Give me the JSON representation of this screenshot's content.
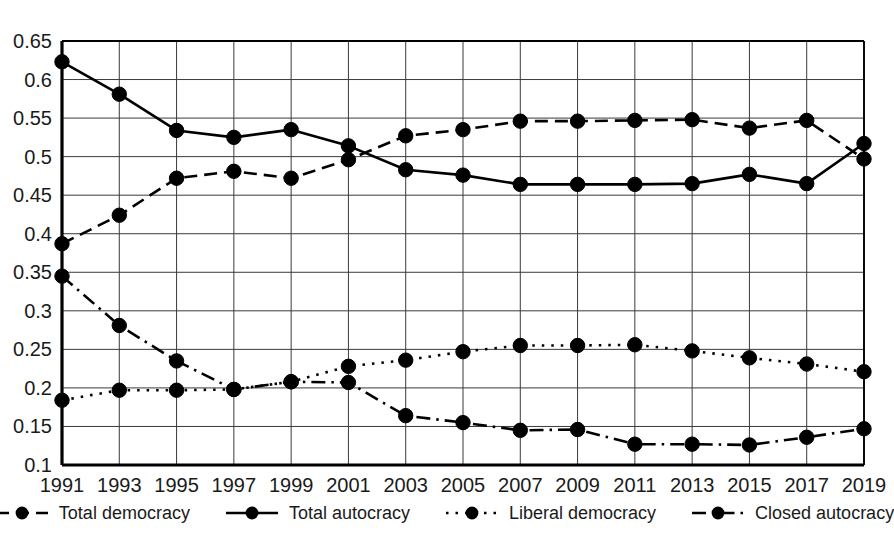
{
  "chart_data": {
    "type": "line",
    "title": "",
    "subtitle": "",
    "xlabel": "",
    "ylabel": "",
    "x": [
      1991,
      1993,
      1995,
      1997,
      1999,
      2001,
      2003,
      2005,
      2007,
      2009,
      2011,
      2013,
      2015,
      2017,
      2019
    ],
    "categories": [
      "1991",
      "1993",
      "1995",
      "1997",
      "1999",
      "2001",
      "2003",
      "2005",
      "2007",
      "2009",
      "2011",
      "2013",
      "2015",
      "2017",
      "2019"
    ],
    "xlim": [
      1991,
      2019
    ],
    "ylim": [
      0.1,
      0.65
    ],
    "yticks": [
      0.1,
      0.15,
      0.2,
      0.25,
      0.3,
      0.35,
      0.4,
      0.45,
      0.5,
      0.55,
      0.6,
      0.65
    ],
    "ytick_labels": [
      "0.1",
      "0.15",
      "0.2",
      "0.25",
      "0.3",
      "0.35",
      "0.4",
      "0.45",
      "0.5",
      "0.55",
      "0.6",
      "0.65"
    ],
    "grid": true,
    "grid_axis": "both",
    "legend_position": "bottom",
    "marker": "filled-circle",
    "color": "#000000",
    "series": [
      {
        "name": "Total democracy",
        "linestyle": "dashed",
        "color": "#000000",
        "values": [
          0.387,
          0.424,
          0.472,
          0.481,
          0.472,
          0.496,
          0.527,
          0.535,
          0.546,
          0.546,
          0.547,
          0.548,
          0.537,
          0.547,
          0.497
        ]
      },
      {
        "name": "Total autocracy",
        "linestyle": "solid",
        "color": "#000000",
        "values": [
          0.623,
          0.581,
          0.534,
          0.525,
          0.535,
          0.514,
          0.483,
          0.476,
          0.464,
          0.464,
          0.464,
          0.465,
          0.477,
          0.465,
          0.517
        ]
      },
      {
        "name": "Liberal democracy",
        "linestyle": "dotted",
        "color": "#000000",
        "values": [
          0.184,
          0.197,
          0.197,
          0.198,
          0.208,
          0.228,
          0.236,
          0.247,
          0.255,
          0.255,
          0.256,
          0.248,
          0.239,
          0.231,
          0.221
        ]
      },
      {
        "name": "Closed autocracy",
        "linestyle": "dashdot",
        "color": "#000000",
        "values": [
          0.345,
          0.281,
          0.235,
          0.198,
          0.208,
          0.207,
          0.164,
          0.155,
          0.145,
          0.146,
          0.127,
          0.127,
          0.126,
          0.136,
          0.147
        ]
      }
    ]
  },
  "legend": {
    "items": [
      {
        "label": "Total democracy",
        "style": "dashed"
      },
      {
        "label": "Total autocracy",
        "style": "solid"
      },
      {
        "label": "Liberal democracy",
        "style": "dotted"
      },
      {
        "label": "Closed autocracy",
        "style": "dashdot"
      }
    ]
  }
}
